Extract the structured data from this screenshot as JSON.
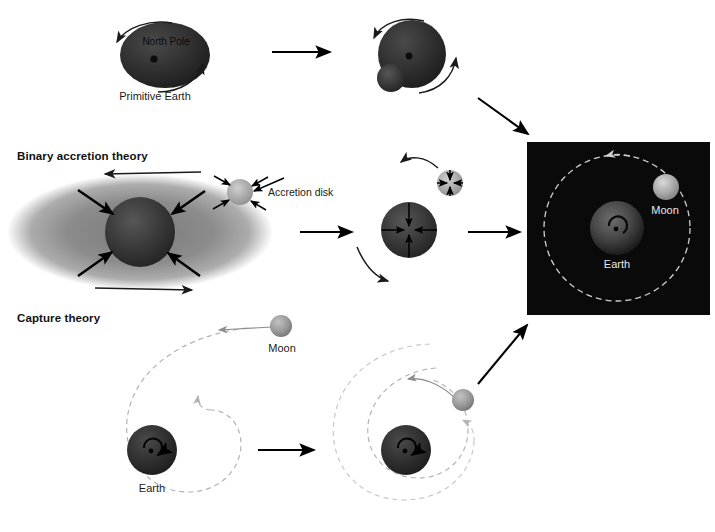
{
  "figure": {
    "width": 715,
    "height": 532,
    "background": "#ffffff"
  },
  "colors": {
    "earth_dark": "#262626",
    "earth_mid": "#3a3a3a",
    "moon_gray": "#8f8f8f",
    "accretion_disk": "#7a7a7a",
    "panel_black": "#0a0a0a",
    "arrow_black": "#000000",
    "orbit_dash": "#b3b3b3",
    "label_dark": "#1a1a1a",
    "label_light": "#e8e8e8"
  },
  "theories": [
    {
      "id": "fission",
      "heading": "",
      "stages": [
        {
          "id": "primitive-earth",
          "caption": "Primitive Earth",
          "pole_label": "North Pole",
          "spin_arrows": 2
        },
        {
          "id": "bulge-forming",
          "caption": "",
          "pole_label": "",
          "spin_arrows": 2
        }
      ]
    },
    {
      "id": "binary-accretion",
      "heading": "Binary accretion theory",
      "stages": [
        {
          "id": "accretion-disk-stage",
          "caption": "",
          "callout": "Accretion disk",
          "rotation_arrows": 2
        },
        {
          "id": "coalescing-bodies",
          "caption": "",
          "callout": "",
          "rotation_arrows": 2
        }
      ]
    },
    {
      "id": "capture",
      "heading": "Capture theory",
      "stages": [
        {
          "id": "approach",
          "earth_label": "Earth",
          "moon_label": "Moon"
        },
        {
          "id": "capture-spiral",
          "earth_label": "",
          "moon_label": ""
        }
      ]
    }
  ],
  "final_panel": {
    "id": "earth-moon-system",
    "background": "#0a0a0a",
    "earth_label": "Earth",
    "moon_label": "Moon",
    "orbit_style": "dashed"
  },
  "labels": {
    "north_pole": "North Pole",
    "primitive_earth": "Primitive Earth",
    "binary_accretion_theory": "Binary accretion theory",
    "accretion_disk": "Accretion disk",
    "capture_theory": "Capture theory",
    "moon": "Moon",
    "earth": "Earth",
    "final_moon": "Moon",
    "final_earth": "Earth"
  }
}
